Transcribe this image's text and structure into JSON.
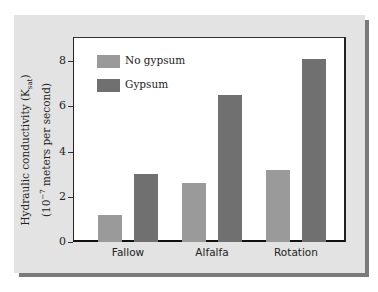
{
  "chart_data": {
    "type": "bar",
    "title": "",
    "xlabel": "",
    "ylabel": "Hydraulic conductivity (K_sat) (10^-7 meters per second)",
    "ylabel_line1": "Hydraulic conductivity (K",
    "ylabel_sub": "sat",
    "ylabel_line1_end": ")",
    "ylabel_line2_a": "(10",
    "ylabel_sup": "−7",
    "ylabel_line2_b": " meters per second)",
    "categories": [
      "Fallow",
      "Alfalfa",
      "Rotation"
    ],
    "series": [
      {
        "name": "No gypsum",
        "values": [
          1.2,
          2.6,
          3.2
        ],
        "color": "#9a9a9a"
      },
      {
        "name": "Gypsum",
        "values": [
          3.0,
          6.5,
          8.1
        ],
        "color": "#707070"
      }
    ],
    "yticks": [
      "0",
      "2",
      "4",
      "6",
      "8"
    ],
    "ylim": [
      0,
      9
    ],
    "grid": false,
    "legend_position": "upper left"
  }
}
